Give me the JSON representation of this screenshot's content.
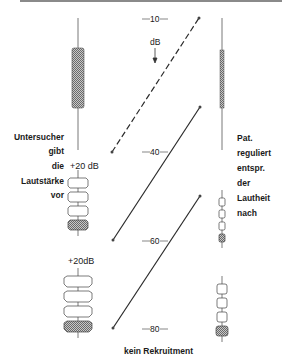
{
  "diagram": {
    "scale": {
      "unit": "dB",
      "ticks": [
        "10",
        "40",
        "60",
        "80"
      ]
    },
    "left_labels": [
      "Untersucher",
      "gibt",
      "die",
      "Lautstärke",
      "vor"
    ],
    "right_labels": [
      "Pat.",
      "reguliert",
      "entspr.",
      "der",
      "Lautheit",
      "nach"
    ],
    "increments": [
      "+20 dB",
      "+20dB"
    ],
    "caption": "kein Rekruitment",
    "colors": {
      "line": "#2a2a2a",
      "hatch": "#9a9a9a",
      "border": "#8a8a8a"
    }
  }
}
